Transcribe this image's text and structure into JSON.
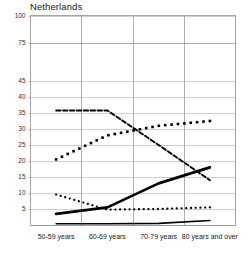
{
  "chart_data": {
    "type": "line",
    "title": "Netherlands",
    "xlabel": "",
    "ylabel": "",
    "categories": [
      "50-59 years",
      "60-69 years",
      "70-79 years",
      "80 years and over"
    ],
    "ytick_labels": [
      "100",
      "75",
      "45",
      "40",
      "35",
      "30",
      "25",
      "20",
      "15",
      "10",
      "5"
    ],
    "ytick_values": [
      100,
      75,
      45,
      40,
      35,
      30,
      25,
      20,
      15,
      10,
      5
    ],
    "ylim": [
      0,
      100
    ],
    "axis_note": "broken axis between 45 and 75",
    "grid": true,
    "legend_position": "none",
    "series": [
      {
        "name": "series-squares-rising",
        "style": "dotted-square-markers",
        "color": "#000000",
        "values": [
          20.5,
          28.0,
          31.0,
          32.5
        ]
      },
      {
        "name": "series-dashed-declining",
        "style": "dashed",
        "color": "#000000",
        "values": [
          35.8,
          35.8,
          25.0,
          14.0
        ]
      },
      {
        "name": "series-solid-thick-rising",
        "style": "solid-thick",
        "color": "#000000",
        "values": [
          3.5,
          5.5,
          13.0,
          18.0
        ]
      },
      {
        "name": "series-round-dots-declining",
        "style": "dotted-round",
        "color": "#000000",
        "values": [
          9.5,
          4.8,
          5.0,
          5.5
        ]
      },
      {
        "name": "series-gray-baseline",
        "style": "solid-thin-gray",
        "color": "#8a8a8a",
        "values": [
          0.4,
          0.4,
          0.5,
          1.4
        ]
      }
    ]
  }
}
